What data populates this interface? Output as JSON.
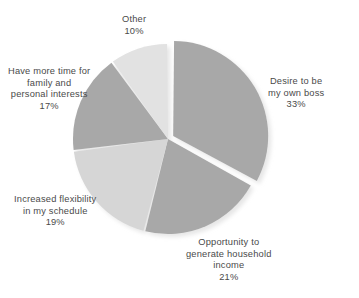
{
  "chart_data": {
    "type": "pie",
    "title": "",
    "xlabel": "",
    "ylabel": "",
    "legend_position": "none",
    "grid": false,
    "units": "percent",
    "start_angle_deg": 0,
    "direction": "clockwise",
    "exploded_slice": "Desire to be my own boss",
    "categories": [
      "Desire to be my own boss",
      "Opportunity to generate household income",
      "Increased flexibility in my schedule",
      "Have more time for family and personal interests",
      "Other"
    ],
    "values": [
      33,
      21,
      19,
      17,
      10
    ],
    "slices": [
      {
        "name": "desire-to-be-my-own-boss",
        "value": 33,
        "value_label": "33%",
        "color": "#a8a8a8",
        "exploded": true,
        "label_lines": [
          "Desire to be",
          "my own boss"
        ]
      },
      {
        "name": "opportunity-to-generate-household-income",
        "value": 21,
        "value_label": "21%",
        "color": "#a8a8a8",
        "exploded": false,
        "label_lines": [
          "Opportunity to",
          "generate household",
          "income"
        ]
      },
      {
        "name": "increased-flexibility-in-my-schedule",
        "value": 19,
        "value_label": "19%",
        "color": "#d6d6d6",
        "exploded": false,
        "label_lines": [
          "Increased flexibility",
          "in my schedule"
        ]
      },
      {
        "name": "have-more-time-for-family-and-personal-interests",
        "value": 17,
        "value_label": "17%",
        "color": "#a8a8a8",
        "exploded": false,
        "label_lines": [
          "Have more time for",
          "family and",
          "personal interests"
        ]
      },
      {
        "name": "other",
        "value": 10,
        "value_label": "10%",
        "color": "#e2e2e2",
        "exploded": false,
        "label_lines": [
          "Other"
        ]
      }
    ]
  },
  "labels": {
    "boss": {
      "line1": "Desire to be",
      "line2": "my own boss",
      "pct": "33%"
    },
    "income": {
      "line1": "Opportunity to",
      "line2": "generate household",
      "line3": "income",
      "pct": "21%"
    },
    "flex": {
      "line1": "Increased flexibility",
      "line2": "in my schedule",
      "pct": "19%"
    },
    "time": {
      "line1": "Have more time for",
      "line2": "family and",
      "line3": "personal interests",
      "pct": "17%"
    },
    "other": {
      "line1": "Other",
      "pct": "10%"
    }
  },
  "style": {
    "background": "#ffffff",
    "text_color": "#4a4a4a",
    "slice_gap_color": "#ffffff",
    "shadow_color": "#cfcfcf"
  }
}
